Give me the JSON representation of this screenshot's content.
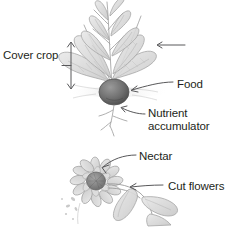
{
  "figure": {
    "type": "botanical-pencil-sketch-diagram",
    "background_color": "#ffffff",
    "text_color": "#231f20",
    "sketch_color": "#8c8c8c"
  },
  "labels": {
    "cover_crop": "Cover crop",
    "food": "Food",
    "nutrient_accumulator": "Nutrient accumulator",
    "nectar": "Nectar",
    "cut_flowers": "Cut flowers"
  },
  "annotations": {
    "cover_crop_bracket": "double-headed-vertical-arrow",
    "food_leader": "curved-arrow-to-root-bulb",
    "nutrient_leader": "curved-arrow-to-taproot",
    "nectar_leader": "curved-arrow-to-flower-head",
    "cut_flowers_leader": "straight-arrow-to-flower-stem",
    "leaf_arrow": "arrow-to-leaf"
  },
  "illustrations": {
    "top_plant": "radish-plant-with-leafy-greens-and-root-bulb",
    "bottom_plant": "sunflower-with-stem-and-leaves"
  }
}
